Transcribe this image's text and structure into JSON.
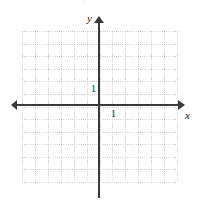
{
  "figure": {
    "kind": "cartesian-coordinate-grid",
    "background_color": "#ffffff",
    "axis_color": "#3a3a3a",
    "grid_color": "#bdbdbd"
  },
  "top_remnant": {
    "fragment_left": "ment",
    "fragment_right": "of y"
  },
  "axes": {
    "x": {
      "label": "x",
      "tick_label": "1",
      "has_left_arrow": true,
      "has_right_arrow": true
    },
    "y": {
      "label": "y",
      "tick_label": "1",
      "has_top_arrow": true,
      "has_bottom_arrow": false
    }
  },
  "chart_data": {
    "type": "scatter",
    "title": "",
    "subtitle": "",
    "xlabel": "x",
    "ylabel": "y",
    "xlim": [
      -6,
      6
    ],
    "ylim": [
      -6,
      6
    ],
    "x_tick_labels": [
      "1"
    ],
    "y_tick_labels": [
      "1"
    ],
    "x_ticks": [
      1
    ],
    "y_ticks": [
      1
    ],
    "grid": true,
    "grid_style": "dotted",
    "grid_spacing_units": 1,
    "legend": null,
    "legend_position": "none",
    "series": [],
    "annotations": [],
    "origin": [
      0,
      0
    ],
    "note": "Empty blank coordinate plane; no data plotted."
  }
}
